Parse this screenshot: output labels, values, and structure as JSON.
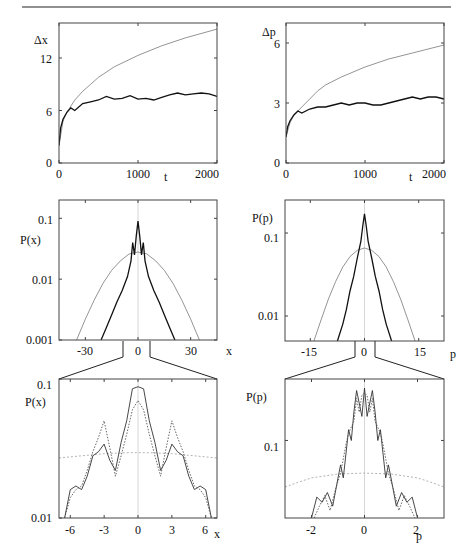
{
  "header": {
    "running_head": ""
  },
  "panels": {
    "tl": {
      "ylabel": "Δx",
      "xlabel": "t",
      "yticks": [
        "0",
        "6",
        "12"
      ],
      "xticks": [
        "0",
        "1000",
        "2000"
      ]
    },
    "tr": {
      "ylabel": "Δp",
      "xlabel": "t",
      "yticks": [
        "0",
        "3",
        "6"
      ],
      "xticks": [
        "0",
        "1000",
        "2000"
      ]
    },
    "ml": {
      "ylabel": "P(x)",
      "xlabel": "x",
      "yticks": [
        "0.001",
        "0.01",
        "0.1"
      ],
      "xticks": [
        "-30",
        "0",
        "30"
      ]
    },
    "mr": {
      "ylabel": "P(p)",
      "xlabel": "p",
      "yticks": [
        "0.01",
        "0.1"
      ],
      "xticks": [
        "-15",
        "0",
        "15"
      ]
    },
    "bl": {
      "ylabel": "P(x)",
      "xlabel": "x",
      "yticks": [
        "0.01",
        "0.1"
      ],
      "xticks": [
        "-6",
        "-3",
        "0",
        "3",
        "6"
      ]
    },
    "br": {
      "ylabel": "P(p)",
      "xlabel": "p",
      "yticks": [
        "0.1"
      ],
      "xticks": [
        "-2",
        "0",
        "2"
      ]
    }
  },
  "chart_data": [
    {
      "id": "tl",
      "type": "line",
      "title": "",
      "xlabel": "t",
      "ylabel": "Δx",
      "xlim": [
        0,
        2000
      ],
      "ylim": [
        0,
        16
      ],
      "x_ticks": [
        0,
        1000,
        2000
      ],
      "y_ticks": [
        0,
        6,
        12
      ],
      "series": [
        {
          "name": "diffusive (gray)",
          "color": "#888888",
          "x": [
            0,
            50,
            100,
            200,
            300,
            400,
            500,
            700,
            1000,
            1300,
            1600,
            2000
          ],
          "y": [
            2,
            4.8,
            5.8,
            7.2,
            8.2,
            9.0,
            9.8,
            11.0,
            12.3,
            13.4,
            14.3,
            15.3
          ]
        },
        {
          "name": "localized (black)",
          "color": "#111111",
          "x": [
            0,
            20,
            50,
            100,
            150,
            200,
            300,
            400,
            500,
            600,
            700,
            800,
            900,
            1000,
            1100,
            1200,
            1300,
            1400,
            1500,
            1600,
            1700,
            1800,
            1900,
            2000
          ],
          "y": [
            2,
            4.0,
            5.0,
            5.8,
            6.3,
            6.0,
            6.8,
            7.0,
            7.2,
            7.6,
            7.3,
            7.4,
            7.7,
            7.3,
            7.4,
            7.2,
            7.5,
            7.8,
            8.0,
            7.8,
            7.9,
            8.0,
            7.9,
            7.6
          ]
        }
      ]
    },
    {
      "id": "tr",
      "type": "line",
      "title": "",
      "xlabel": "t",
      "ylabel": "Δp",
      "xlim": [
        0,
        2000
      ],
      "ylim": [
        0,
        7
      ],
      "x_ticks": [
        0,
        1000,
        2000
      ],
      "y_ticks": [
        0,
        3,
        6
      ],
      "series": [
        {
          "name": "diffusive (gray)",
          "color": "#888888",
          "x": [
            0,
            50,
            100,
            200,
            300,
            400,
            500,
            700,
            1000,
            1300,
            1600,
            2000
          ],
          "y": [
            1.3,
            2.0,
            2.4,
            2.8,
            3.2,
            3.6,
            3.9,
            4.3,
            4.8,
            5.2,
            5.5,
            5.9
          ]
        },
        {
          "name": "localized (black)",
          "color": "#111111",
          "x": [
            0,
            20,
            50,
            100,
            150,
            200,
            300,
            400,
            500,
            600,
            700,
            800,
            900,
            1000,
            1100,
            1200,
            1300,
            1400,
            1500,
            1600,
            1700,
            1800,
            1900,
            2000
          ],
          "y": [
            1.3,
            1.8,
            2.1,
            2.4,
            2.6,
            2.5,
            2.7,
            2.8,
            2.8,
            2.9,
            3.0,
            2.9,
            3.0,
            3.0,
            2.9,
            2.9,
            3.0,
            3.1,
            3.2,
            3.3,
            3.2,
            3.3,
            3.3,
            3.2
          ]
        }
      ]
    },
    {
      "id": "ml",
      "type": "line",
      "title": "",
      "xlabel": "x",
      "ylabel": "P(x)",
      "yscale": "log",
      "xlim": [
        -45,
        45
      ],
      "ylim": [
        0.001,
        0.2
      ],
      "x_ticks": [
        -30,
        0,
        30
      ],
      "y_ticks": [
        0.001,
        0.01,
        0.1
      ],
      "series": [
        {
          "name": "gaussian (gray)",
          "color": "#888888",
          "x": [
            -35,
            -30,
            -25,
            -20,
            -15,
            -10,
            -5,
            0,
            5,
            10,
            15,
            20,
            25,
            30,
            35
          ],
          "y": [
            0.001,
            0.0022,
            0.0045,
            0.0085,
            0.014,
            0.02,
            0.026,
            0.028,
            0.026,
            0.02,
            0.014,
            0.0085,
            0.0045,
            0.0022,
            0.001
          ]
        },
        {
          "name": "localized (black)",
          "color": "#111111",
          "x": [
            -21,
            -18,
            -15,
            -12,
            -9,
            -6,
            -4,
            -3,
            -2,
            -1,
            0,
            1,
            2,
            3,
            4,
            6,
            9,
            12,
            15,
            18,
            21
          ],
          "y": [
            0.001,
            0.0016,
            0.0026,
            0.0042,
            0.0065,
            0.011,
            0.02,
            0.04,
            0.025,
            0.05,
            0.09,
            0.05,
            0.025,
            0.04,
            0.02,
            0.011,
            0.0065,
            0.0042,
            0.0026,
            0.0016,
            0.001
          ]
        }
      ]
    },
    {
      "id": "mr",
      "type": "line",
      "title": "",
      "xlabel": "p",
      "ylabel": "P(p)",
      "yscale": "log",
      "xlim": [
        -22,
        22
      ],
      "ylim": [
        0.005,
        0.25
      ],
      "x_ticks": [
        -15,
        0,
        15
      ],
      "y_ticks": [
        0.01,
        0.1
      ],
      "series": [
        {
          "name": "gaussian (gray)",
          "color": "#888888",
          "x": [
            -14,
            -12,
            -10,
            -8,
            -6,
            -4,
            -2,
            0,
            2,
            4,
            6,
            8,
            10,
            12,
            14
          ],
          "y": [
            0.005,
            0.009,
            0.016,
            0.026,
            0.039,
            0.052,
            0.062,
            0.066,
            0.062,
            0.052,
            0.039,
            0.026,
            0.016,
            0.009,
            0.005
          ]
        },
        {
          "name": "localized (black)",
          "color": "#111111",
          "x": [
            -7.5,
            -6,
            -5,
            -4,
            -3,
            -2,
            -1,
            -0.5,
            0,
            0.5,
            1,
            2,
            3,
            4,
            5,
            6,
            7.5
          ],
          "y": [
            0.005,
            0.008,
            0.012,
            0.02,
            0.03,
            0.05,
            0.08,
            0.12,
            0.17,
            0.12,
            0.08,
            0.05,
            0.03,
            0.02,
            0.012,
            0.008,
            0.005
          ]
        }
      ]
    },
    {
      "id": "bl",
      "type": "line",
      "title": "",
      "xlabel": "x",
      "ylabel": "P(x)",
      "yscale": "log",
      "xlim": [
        -7,
        7
      ],
      "ylim": [
        0.01,
        0.1
      ],
      "x_ticks": [
        -6,
        -3,
        0,
        3,
        6
      ],
      "y_ticks": [
        0.01,
        0.1
      ],
      "series": [
        {
          "name": "gaussian (gray dotted)",
          "color": "#aaaaaa",
          "dash": "2,2",
          "x": [
            -7,
            -5,
            -3,
            -1,
            0,
            1,
            3,
            5,
            7
          ],
          "y": [
            0.027,
            0.028,
            0.029,
            0.0295,
            0.0295,
            0.0295,
            0.029,
            0.028,
            0.027
          ]
        },
        {
          "name": "solid (black)",
          "color": "#333333",
          "x": [
            -6.5,
            -6,
            -5.5,
            -5,
            -4.5,
            -4,
            -3.5,
            -3,
            -2.5,
            -2,
            -1.5,
            -1,
            -0.5,
            0,
            0.5,
            1,
            1.5,
            2,
            2.5,
            3,
            3.5,
            4,
            4.5,
            5,
            5.5,
            6,
            6.5
          ],
          "y": [
            0.01,
            0.016,
            0.017,
            0.016,
            0.02,
            0.028,
            0.03,
            0.034,
            0.026,
            0.022,
            0.035,
            0.05,
            0.085,
            0.088,
            0.085,
            0.05,
            0.035,
            0.022,
            0.026,
            0.034,
            0.03,
            0.028,
            0.02,
            0.016,
            0.017,
            0.016,
            0.01
          ]
        },
        {
          "name": "dotted (black)",
          "color": "#555555",
          "dash": "1.5,1.5",
          "x": [
            -6.5,
            -6,
            -5.5,
            -5,
            -4.5,
            -4,
            -3.5,
            -3,
            -2.5,
            -2,
            -1.5,
            -1,
            -0.5,
            0,
            0.5,
            1,
            1.5,
            2,
            2.5,
            3,
            3.5,
            4,
            4.5,
            5,
            5.5,
            6,
            6.5
          ],
          "y": [
            0.01,
            0.014,
            0.016,
            0.017,
            0.022,
            0.03,
            0.038,
            0.05,
            0.032,
            0.02,
            0.028,
            0.04,
            0.06,
            0.07,
            0.06,
            0.04,
            0.028,
            0.02,
            0.032,
            0.05,
            0.038,
            0.03,
            0.022,
            0.017,
            0.016,
            0.014,
            0.01
          ]
        }
      ]
    },
    {
      "id": "br",
      "type": "line",
      "title": "",
      "xlabel": "p",
      "ylabel": "P(p)",
      "yscale": "log",
      "xlim": [
        -3,
        3
      ],
      "ylim": [
        0.015,
        0.45
      ],
      "x_ticks": [
        -2,
        0,
        2
      ],
      "y_ticks": [
        0.1
      ],
      "series": [
        {
          "name": "gaussian (gray dotted)",
          "color": "#aaaaaa",
          "dash": "2,2",
          "x": [
            -3,
            -2.5,
            -2,
            -1,
            0,
            1,
            2,
            2.5,
            3
          ],
          "y": [
            0.032,
            0.036,
            0.04,
            0.044,
            0.045,
            0.044,
            0.04,
            0.036,
            0.032
          ]
        },
        {
          "name": "solid (black)",
          "color": "#333333",
          "x": [
            -2,
            -1.8,
            -1.6,
            -1.4,
            -1.2,
            -1.0,
            -0.9,
            -0.8,
            -0.6,
            -0.5,
            -0.4,
            -0.3,
            -0.2,
            -0.1,
            0,
            0.1,
            0.2,
            0.3,
            0.4,
            0.5,
            0.6,
            0.8,
            0.9,
            1.0,
            1.2,
            1.4,
            1.6,
            1.8,
            2
          ],
          "y": [
            0.015,
            0.025,
            0.022,
            0.028,
            0.02,
            0.04,
            0.055,
            0.04,
            0.13,
            0.1,
            0.2,
            0.34,
            0.25,
            0.18,
            0.36,
            0.18,
            0.25,
            0.34,
            0.2,
            0.1,
            0.13,
            0.04,
            0.055,
            0.04,
            0.02,
            0.028,
            0.022,
            0.025,
            0.015
          ]
        },
        {
          "name": "dotted (black)",
          "color": "#555555",
          "dash": "1.5,1.5",
          "x": [
            -1.9,
            -1.7,
            -1.5,
            -1.3,
            -1.1,
            -0.9,
            -0.7,
            -0.6,
            -0.4,
            -0.3,
            -0.2,
            -0.1,
            0,
            0.1,
            0.2,
            0.3,
            0.4,
            0.6,
            0.7,
            0.9,
            1.1,
            1.3,
            1.5,
            1.7,
            1.9
          ],
          "y": [
            0.015,
            0.02,
            0.026,
            0.018,
            0.03,
            0.045,
            0.09,
            0.12,
            0.16,
            0.28,
            0.2,
            0.3,
            0.32,
            0.3,
            0.2,
            0.28,
            0.16,
            0.12,
            0.09,
            0.045,
            0.03,
            0.018,
            0.026,
            0.02,
            0.015
          ]
        }
      ]
    }
  ]
}
